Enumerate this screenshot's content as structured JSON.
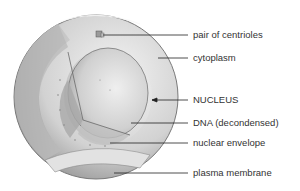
{
  "diagram": {
    "labels": [
      {
        "id": "centrioles",
        "text": "pair of centrioles",
        "y": 35,
        "line_start_x": 103,
        "arrow": false
      },
      {
        "id": "cytoplasm",
        "text": "cytoplasm",
        "y": 58,
        "line_start_x": 158,
        "arrow": false
      },
      {
        "id": "nucleus",
        "text": "NUCLEUS",
        "y": 100,
        "line_start_x": 152,
        "arrow": true
      },
      {
        "id": "dna",
        "text": "DNA (decondensed)",
        "y": 123,
        "line_start_x": 131,
        "arrow": false
      },
      {
        "id": "nuclear-envelope",
        "text": "nuclear envelope",
        "y": 143,
        "line_start_x": 110,
        "arrow": false
      },
      {
        "id": "plasma-membrane",
        "text": "plasma membrane",
        "y": 173,
        "line_start_x": 114,
        "arrow": false
      }
    ],
    "colors": {
      "line": "#222222",
      "text": "#333333",
      "background": "#ffffff"
    }
  }
}
